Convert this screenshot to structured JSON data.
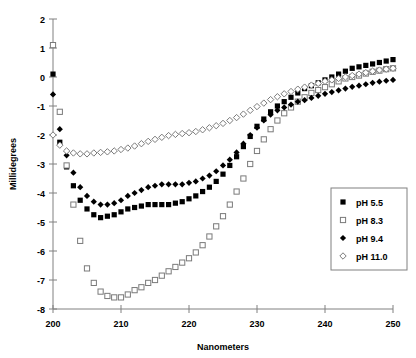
{
  "chart_data": {
    "type": "scatter",
    "title": "",
    "xlabel": "Nanometers",
    "ylabel": "Millidegrees",
    "xlim": [
      200,
      250
    ],
    "ylim": [
      -8,
      2
    ],
    "xticks": [
      200,
      210,
      220,
      230,
      240,
      250
    ],
    "yticks": [
      2,
      1,
      0,
      -1,
      -2,
      -3,
      -4,
      -5,
      -6,
      -7,
      -8
    ],
    "grid": false,
    "legend_position": "right-bottom",
    "series": [
      {
        "name": "pH 5.5",
        "marker": "filled-square",
        "color": "#000000",
        "x": [
          200,
          201,
          202,
          203,
          204,
          205,
          206,
          207,
          208,
          209,
          210,
          211,
          212,
          213,
          214,
          215,
          216,
          217,
          218,
          219,
          220,
          221,
          222,
          223,
          224,
          225,
          226,
          227,
          228,
          229,
          230,
          231,
          232,
          233,
          234,
          235,
          236,
          237,
          238,
          239,
          240,
          241,
          242,
          243,
          244,
          245,
          246,
          247,
          248,
          249,
          250
        ],
        "y": [
          0.1,
          -2.25,
          -3.1,
          -3.75,
          -4.25,
          -4.55,
          -4.75,
          -4.85,
          -4.8,
          -4.75,
          -4.65,
          -4.55,
          -4.5,
          -4.45,
          -4.4,
          -4.4,
          -4.4,
          -4.4,
          -4.35,
          -4.3,
          -4.2,
          -4.1,
          -3.95,
          -3.8,
          -3.6,
          -3.35,
          -3.05,
          -2.75,
          -2.4,
          -2.05,
          -1.7,
          -1.45,
          -1.2,
          -1.0,
          -0.85,
          -0.7,
          -0.55,
          -0.4,
          -0.3,
          -0.2,
          -0.1,
          0.0,
          0.1,
          0.2,
          0.3,
          0.35,
          0.4,
          0.45,
          0.5,
          0.55,
          0.6
        ]
      },
      {
        "name": "pH 8.3",
        "marker": "open-square",
        "color": "#ffffff",
        "x": [
          200,
          201,
          202,
          203,
          204,
          205,
          206,
          207,
          208,
          209,
          210,
          211,
          212,
          213,
          214,
          215,
          216,
          217,
          218,
          219,
          220,
          221,
          222,
          223,
          224,
          225,
          226,
          227,
          228,
          229,
          230,
          231,
          232,
          233,
          234,
          235,
          236,
          237,
          238,
          239,
          240,
          241,
          242,
          243,
          244,
          245,
          246,
          247,
          248,
          249,
          250
        ],
        "y": [
          1.1,
          -1.2,
          -3.05,
          -4.4,
          -5.65,
          -6.6,
          -7.1,
          -7.4,
          -7.55,
          -7.6,
          -7.6,
          -7.5,
          -7.35,
          -7.25,
          -7.1,
          -7.0,
          -6.85,
          -6.7,
          -6.55,
          -6.4,
          -6.25,
          -6.05,
          -5.8,
          -5.5,
          -5.15,
          -4.8,
          -4.4,
          -3.95,
          -3.5,
          -3.0,
          -2.55,
          -2.15,
          -1.8,
          -1.5,
          -1.25,
          -1.05,
          -0.85,
          -0.7,
          -0.55,
          -0.45,
          -0.35,
          -0.25,
          -0.15,
          -0.05,
          0.0,
          0.05,
          0.12,
          0.18,
          0.22,
          0.27,
          0.3
        ]
      },
      {
        "name": "pH 9.4",
        "marker": "filled-diamond",
        "color": "#000000",
        "x": [
          200,
          201,
          202,
          203,
          204,
          205,
          206,
          207,
          208,
          209,
          210,
          211,
          212,
          213,
          214,
          215,
          216,
          217,
          218,
          219,
          220,
          221,
          222,
          223,
          224,
          225,
          226,
          227,
          228,
          229,
          230,
          231,
          232,
          233,
          234,
          235,
          236,
          237,
          238,
          239,
          240,
          241,
          242,
          243,
          244,
          245,
          246,
          247,
          248,
          249,
          250
        ],
        "y": [
          -0.6,
          -1.8,
          -2.7,
          -3.3,
          -3.8,
          -4.1,
          -4.3,
          -4.4,
          -4.4,
          -4.35,
          -4.25,
          -4.1,
          -4.0,
          -3.9,
          -3.8,
          -3.75,
          -3.7,
          -3.7,
          -3.7,
          -3.7,
          -3.65,
          -3.6,
          -3.5,
          -3.4,
          -3.25,
          -3.05,
          -2.85,
          -2.6,
          -2.3,
          -2.0,
          -1.75,
          -1.5,
          -1.3,
          -1.15,
          -1.05,
          -0.95,
          -0.85,
          -0.8,
          -0.72,
          -0.65,
          -0.58,
          -0.52,
          -0.46,
          -0.4,
          -0.34,
          -0.3,
          -0.25,
          -0.2,
          -0.16,
          -0.13,
          -0.1
        ]
      },
      {
        "name": "pH 11.0",
        "marker": "open-diamond",
        "color": "#ffffff",
        "x": [
          200,
          201,
          202,
          203,
          204,
          205,
          206,
          207,
          208,
          209,
          210,
          211,
          212,
          213,
          214,
          215,
          216,
          217,
          218,
          219,
          220,
          221,
          222,
          223,
          224,
          225,
          226,
          227,
          228,
          229,
          230,
          231,
          232,
          233,
          234,
          235,
          236,
          237,
          238,
          239,
          240,
          241,
          242,
          243,
          244,
          245,
          246,
          247,
          248,
          249,
          250
        ],
        "y": [
          -2.0,
          -2.35,
          -2.55,
          -2.62,
          -2.65,
          -2.65,
          -2.62,
          -2.6,
          -2.58,
          -2.55,
          -2.5,
          -2.45,
          -2.38,
          -2.3,
          -2.22,
          -2.15,
          -2.08,
          -2.02,
          -1.98,
          -1.95,
          -1.92,
          -1.88,
          -1.82,
          -1.75,
          -1.68,
          -1.6,
          -1.5,
          -1.4,
          -1.28,
          -1.15,
          -1.02,
          -0.9,
          -0.78,
          -0.68,
          -0.58,
          -0.5,
          -0.42,
          -0.35,
          -0.28,
          -0.22,
          -0.15,
          -0.1,
          -0.05,
          0.0,
          0.05,
          0.1,
          0.15,
          0.2,
          0.24,
          0.27,
          0.3
        ]
      }
    ]
  },
  "legend": {
    "entries": [
      {
        "label": "pH 5.5"
      },
      {
        "label": "pH 8.3"
      },
      {
        "label": "pH 9.4"
      },
      {
        "label": "pH 11.0"
      }
    ]
  },
  "axes": {
    "x_title": "Nanometers",
    "y_title": "Millidegrees"
  }
}
